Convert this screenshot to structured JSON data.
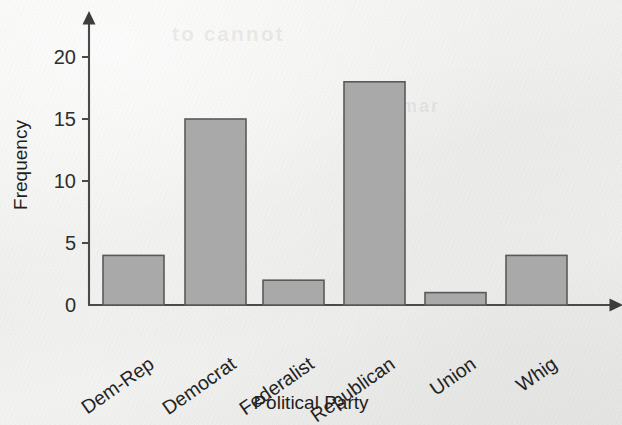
{
  "chart_data": {
    "type": "bar",
    "title": "",
    "xlabel": "Political Party",
    "ylabel": "Frequency",
    "categories": [
      "Dem-Rep",
      "Democrat",
      "Federalist",
      "Republican",
      "Union",
      "Whig"
    ],
    "values": [
      4,
      15,
      2,
      18,
      1,
      4
    ],
    "ylim": [
      0,
      21
    ],
    "yticks": [
      0,
      5,
      10,
      15,
      20
    ],
    "ytick_labels": [
      "0",
      "5",
      "10",
      "15",
      "20"
    ],
    "xtick_rotation_deg": -35,
    "grid": false,
    "legend": null,
    "axis_style": "arrow-tipped",
    "colors": {
      "bar_fill": "#a9a9a9",
      "bar_stroke": "#5a5a5a",
      "axis": "#4a4a4a",
      "text": "#232323",
      "background": "#f1f1ef"
    }
  },
  "geometry": {
    "x_axis_y": 305,
    "y_axis_x": 89,
    "y_zero_px": 305,
    "px_per_unit": 12.4,
    "bar_width_px": 61,
    "bar_lefts_px": [
      103,
      185,
      263,
      344,
      425,
      506
    ],
    "y_axis_top_px": 22,
    "x_axis_right_px": 612
  },
  "ghost_text": {
    "line_one": "to cannot",
    "line_two": "rmar"
  }
}
